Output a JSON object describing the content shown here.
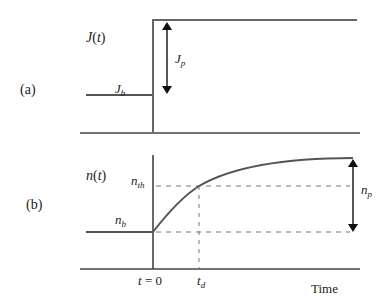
{
  "panel_a": {
    "tag": "(a)",
    "ylabel": "J(t)",
    "ylabel_fn": "J",
    "ylabel_arg": "t",
    "baseline_label": "J",
    "baseline_sub": "b",
    "pulse_label": "J",
    "pulse_sub": "p"
  },
  "panel_b": {
    "tag": "(b)",
    "ylabel_fn": "n",
    "ylabel_arg": "t",
    "threshold_label": "n",
    "threshold_sub": "th",
    "baseline_label": "n",
    "baseline_sub": "b",
    "peak_label": "n",
    "peak_sub": "p",
    "t0_label": "t = 0",
    "td_label": "t",
    "td_sub": "d",
    "xlabel": "Time"
  },
  "colors": {
    "trace": "#555555",
    "axis": "#444444",
    "dash": "#777777",
    "arrow": "#111111"
  }
}
